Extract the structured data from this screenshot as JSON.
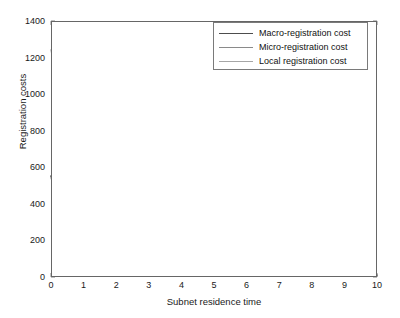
{
  "chart_data": {
    "type": "line",
    "title": "",
    "xlabel": "Subnet residence time",
    "ylabel": "Registration costs",
    "xlim": [
      0,
      10
    ],
    "ylim": [
      0,
      1400
    ],
    "xticks": [
      0,
      1,
      2,
      3,
      4,
      5,
      6,
      7,
      8,
      9,
      10
    ],
    "yticks": [
      0,
      200,
      400,
      600,
      800,
      1000,
      1200,
      1400
    ],
    "grid": false,
    "legend_position": "upper right",
    "x": [
      0,
      1,
      2,
      3,
      4,
      5,
      6,
      7,
      8,
      9,
      10
    ],
    "series": [
      {
        "name": "Macro-registration cost",
        "color": "#4d4d4d",
        "values": [
          552,
          45,
          41,
          37,
          32,
          27,
          23,
          19,
          15,
          12,
          9
        ]
      },
      {
        "name": "Micro-registration cost",
        "color": "#8a8a8a",
        "values": [
          1243,
          122,
          112,
          102,
          92,
          80,
          68,
          55,
          42,
          27,
          11
        ]
      },
      {
        "name": "Local registration cost",
        "color": "#a6a6a6",
        "values": [
          540,
          44,
          40,
          36,
          31,
          26,
          22,
          18,
          15,
          12,
          9
        ]
      }
    ]
  },
  "legend": {
    "items": [
      {
        "label": "Macro-registration cost"
      },
      {
        "label": "Micro-registration cost"
      },
      {
        "label": "Local registration cost"
      }
    ]
  },
  "axes": {
    "ylabel": "Registration costs",
    "xlabel": "Subnet residence time",
    "ytick_labels": [
      "0",
      "200",
      "400",
      "600",
      "800",
      "1000",
      "1200",
      "1400"
    ],
    "xtick_labels": [
      "0",
      "1",
      "2",
      "3",
      "4",
      "5",
      "6",
      "7",
      "8",
      "9",
      "10"
    ]
  }
}
